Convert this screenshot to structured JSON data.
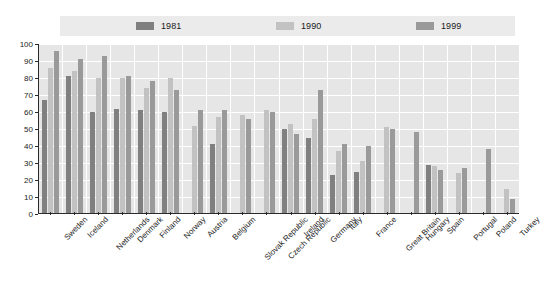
{
  "chart_data": {
    "type": "bar",
    "title": "",
    "subtitle": "",
    "xlabel": "",
    "ylabel": "",
    "ylim": [
      0,
      100
    ],
    "yticks": [
      0,
      10,
      20,
      30,
      40,
      50,
      60,
      70,
      80,
      90,
      100
    ],
    "grid": true,
    "legend_position": "top",
    "categories": [
      "Sweden",
      "Iceland",
      "Netherlands",
      "Denmark",
      "Finland",
      "Norway",
      "Austria",
      "Belgium",
      "Slovak Republic",
      "Czech Republic",
      "Ireland",
      "Germany",
      "Italy",
      "France",
      "Great Britain",
      "Hungary",
      "Spain",
      "Portugal",
      "Poland",
      "Turkey"
    ],
    "series": [
      {
        "name": "1981",
        "color": "#808080",
        "values": [
          67,
          81,
          60,
          62,
          61,
          60,
          null,
          41,
          null,
          null,
          50,
          45,
          23,
          25,
          null,
          null,
          29,
          null,
          null,
          null
        ]
      },
      {
        "name": "1990",
        "color": "#c2c2c2",
        "values": [
          86,
          84,
          80,
          80,
          74,
          80,
          52,
          57,
          58,
          61,
          53,
          56,
          37,
          31,
          51,
          null,
          28,
          24,
          null,
          15
        ]
      },
      {
        "name": "1999",
        "color": "#9a9a9a",
        "values": [
          96,
          91,
          93,
          81,
          78,
          73,
          61,
          61,
          56,
          60,
          47,
          73,
          41,
          40,
          50,
          48,
          26,
          27,
          38,
          9
        ]
      }
    ]
  },
  "legend": {
    "items": [
      {
        "label": "1981",
        "color": "#808080"
      },
      {
        "label": "1990",
        "color": "#c2c2c2"
      },
      {
        "label": "1999",
        "color": "#9a9a9a"
      }
    ]
  },
  "axes": {
    "y_tick_labels": [
      "100",
      "90",
      "80",
      "70",
      "60",
      "50",
      "40",
      "30",
      "20",
      "10",
      "0"
    ]
  },
  "colors": {
    "plot_background": "#e6e6e6",
    "legend_background": "#ebebeb",
    "gridline": "#ffffff",
    "axis": "#2b2b2b",
    "text": "#1a1a1a"
  }
}
